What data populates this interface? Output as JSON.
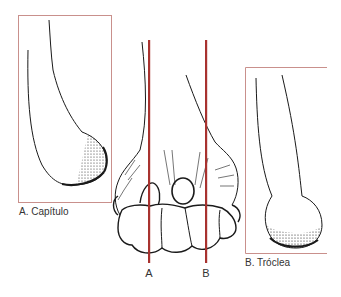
{
  "figure": {
    "panel_a": {
      "caption": "A. Capítulo"
    },
    "panel_b": {
      "caption": "B. Tróclea"
    },
    "center": {
      "lines": [
        {
          "id": "A",
          "label": "A"
        },
        {
          "id": "B",
          "label": "B"
        }
      ]
    },
    "colors": {
      "box_border": "#c9908c",
      "section_line": "#a8322f",
      "ink": "#1a1a1a"
    }
  }
}
